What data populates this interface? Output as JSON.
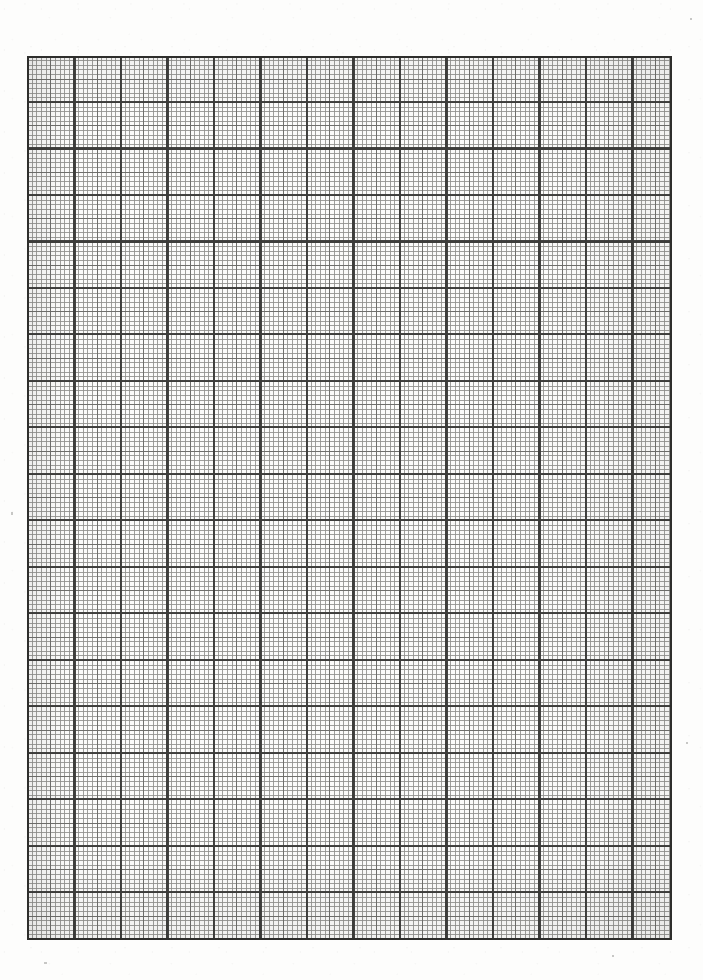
{
  "document": {
    "kind": "graph-paper-scan",
    "title": "Millimeter Graph Paper (blank scanned sheet)",
    "page_width_px": 703,
    "page_height_px": 980,
    "page_background_hex": "#fdfdfc",
    "has_text": false,
    "has_labels": false,
    "has_plotted_data": false,
    "notes": "Blank sheet of ruled millimetre/engineering graph paper. No axis labels, tick numbers, legend, title or plotted data are printed on the sheet."
  },
  "grid": {
    "left_px": 27,
    "top_px": 56,
    "width_px": 645,
    "height_px": 884,
    "right_px": 672,
    "bottom_px": 940,
    "interior_background_hex": "#fbfbfa",
    "fine": {
      "label": "fine-grid",
      "spacing_px": 4.65,
      "line_width_px": 1,
      "color_hex": "#8f8f8c",
      "opacity": 0.85,
      "divisions_per_major": 10
    },
    "medium": {
      "label": "medium-grid",
      "spacing_px": 23.25,
      "line_width_px": 1,
      "color_hex": "#6a6a67",
      "opacity": 0.9,
      "divisions_per_major": 2
    },
    "major": {
      "label": "major-grid",
      "spacing_px": 46.5,
      "line_width_px": 2,
      "color_hex": "#3b3b39",
      "opacity": 0.95,
      "columns": 14,
      "rows": 19
    },
    "frame": {
      "label": "grid-border",
      "line_width_px": 2,
      "color_hex": "#2e2e2c"
    }
  },
  "chart_data": {
    "type": "table",
    "title": "",
    "subtitle": "",
    "xlabel": "",
    "ylabel": "",
    "categories": [],
    "values": [],
    "series": [],
    "tick_labels": {
      "x": [],
      "y": []
    },
    "legend_entries": [],
    "annotations": [],
    "grid": "on",
    "legend_position": "none",
    "grid_geometry": {
      "major_columns": 14,
      "major_rows": 19,
      "minor_divisions_per_major": 10,
      "medium_divisions_per_major": 2,
      "major_spacing_px": 46.5,
      "medium_spacing_px": 23.25,
      "fine_spacing_px": 4.65
    }
  },
  "stray_marks": [
    {
      "name": "scan-speck-top-right",
      "left_px": 690,
      "top_px": 18,
      "width_px": 2,
      "height_px": 2
    },
    {
      "name": "scan-speck-left-margin",
      "left_px": 11,
      "top_px": 512,
      "width_px": 2,
      "height_px": 3
    },
    {
      "name": "scan-speck-bottom-left",
      "left_px": 44,
      "top_px": 962,
      "width_px": 3,
      "height_px": 2
    },
    {
      "name": "scan-speck-bottom-right",
      "left_px": 612,
      "top_px": 955,
      "width_px": 2,
      "height_px": 2
    },
    {
      "name": "scan-speck-right-margin",
      "left_px": 686,
      "top_px": 742,
      "width_px": 2,
      "height_px": 2
    }
  ]
}
